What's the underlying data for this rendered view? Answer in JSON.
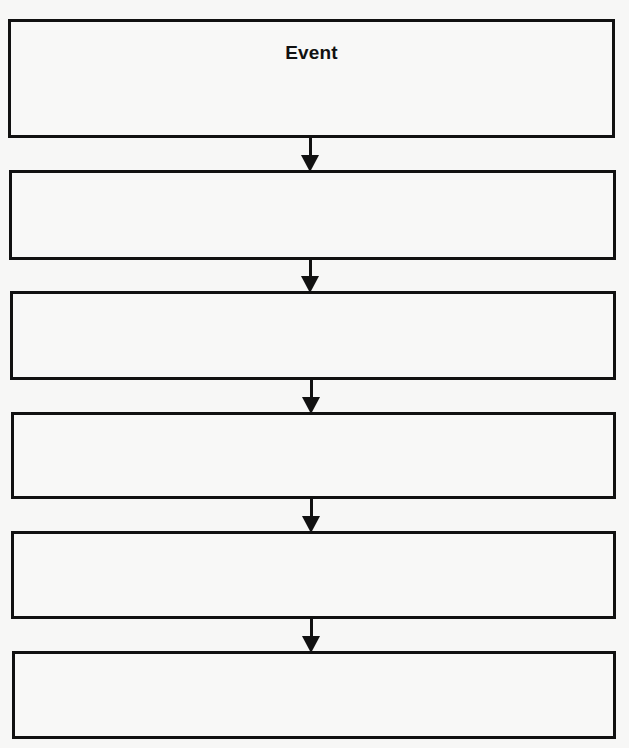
{
  "diagram": {
    "type": "vertical-flowchart",
    "colors": {
      "stroke": "#111111",
      "background": "#f7f7f6"
    },
    "boxes": [
      {
        "label": "Event"
      },
      {
        "label": ""
      },
      {
        "label": ""
      },
      {
        "label": ""
      },
      {
        "label": ""
      },
      {
        "label": ""
      }
    ],
    "connectors": [
      {
        "from": 0,
        "to": 1,
        "icon": "arrow-down-icon"
      },
      {
        "from": 1,
        "to": 2,
        "icon": "arrow-down-icon"
      },
      {
        "from": 2,
        "to": 3,
        "icon": "arrow-down-icon"
      },
      {
        "from": 3,
        "to": 4,
        "icon": "arrow-down-icon"
      },
      {
        "from": 4,
        "to": 5,
        "icon": "arrow-down-icon"
      }
    ]
  }
}
